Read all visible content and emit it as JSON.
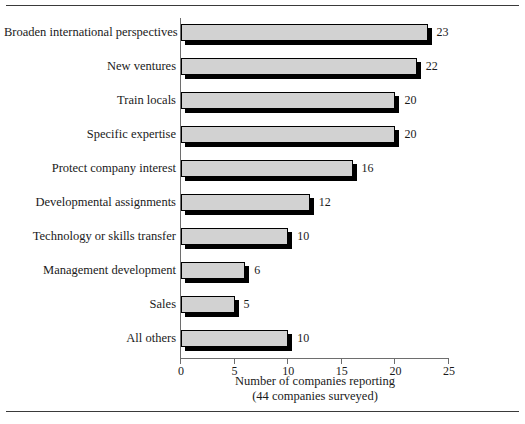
{
  "chart_data": {
    "type": "bar",
    "orientation": "horizontal",
    "title": "",
    "xlabel": "Number of companies reporting",
    "xlabel_sub": "(44 companies surveyed)",
    "ylabel": "",
    "xlim": [
      0,
      25
    ],
    "xticks": [
      0,
      5,
      10,
      15,
      20,
      25
    ],
    "xtick_labels": [
      "0",
      "5",
      "10",
      "15",
      "20",
      "25"
    ],
    "grid": false,
    "legend": null,
    "categories": [
      "Broaden international perspectives",
      "New ventures",
      "Train locals",
      "Specific expertise",
      "Protect company interest",
      "Developmental assignments",
      "Technology or skills transfer",
      "Management development",
      "Sales",
      "All others"
    ],
    "values": [
      23,
      22,
      20,
      20,
      16,
      12,
      10,
      6,
      5,
      10
    ],
    "value_labels": [
      "23",
      "22",
      "20",
      "20",
      "16",
      "12",
      "10",
      "6",
      "5",
      "10"
    ],
    "colors": {
      "bar_face": "#d2d2d2",
      "bar_edge": "#000000",
      "bar_shadow": "#000000",
      "axis": "#6e6e6e",
      "text": "#1a1a1a",
      "rule": "#3a3a3a",
      "background": "#ffffff"
    }
  }
}
